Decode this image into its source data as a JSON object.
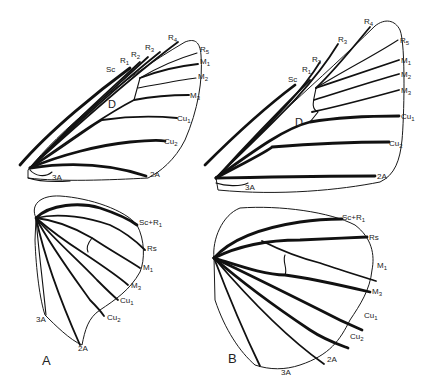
{
  "figure": {
    "panels": [
      {
        "id": "A",
        "label": "A",
        "forewing": {
          "cell_label": "D",
          "vein_labels": [
            "Sc",
            "R1",
            "R2",
            "R3",
            "R4",
            "R5",
            "M1",
            "M2",
            "M3",
            "Cu1",
            "Cu2",
            "2A",
            "3A"
          ]
        },
        "hindwing": {
          "vein_labels": [
            "Sc+R1",
            "Rs",
            "M1",
            "M3",
            "Cu1",
            "Cu2",
            "2A",
            "3A"
          ]
        }
      },
      {
        "id": "B",
        "label": "B",
        "forewing": {
          "cell_label": "D",
          "vein_labels": [
            "Sc",
            "R1",
            "R2",
            "R3",
            "R4",
            "R5",
            "M1",
            "M2",
            "M3",
            "Cu1",
            "Cu2",
            "2A",
            "3A"
          ]
        },
        "hindwing": {
          "vein_labels": [
            "Sc+R1",
            "Rs",
            "M1",
            "M3",
            "Cu1",
            "Cu2",
            "2A",
            "3A"
          ]
        }
      }
    ]
  },
  "labels": {
    "A": {
      "fw": {
        "Sc": "Sc",
        "R1": "R1",
        "R2": "R2",
        "R3": "R3",
        "R4": "R4",
        "R5": "R5",
        "M1": "M1",
        "M2": "M2",
        "M3": "M3",
        "Cu1": "Cu1",
        "Cu2": "Cu2",
        "A2": "2A",
        "A3": "3A",
        "D": "D"
      },
      "hw": {
        "ScR1": "Sc+R1",
        "Rs": "Rs",
        "M1": "M1",
        "M3": "M3",
        "Cu1": "Cu1",
        "Cu2": "Cu2",
        "A2": "2A",
        "A3": "3A"
      },
      "panel": "A"
    },
    "B": {
      "fw": {
        "Sc": "Sc",
        "R1": "R1",
        "R2": "R2",
        "R3": "R3",
        "R4": "R4",
        "R5": "R5",
        "M1": "M1",
        "M2": "M2",
        "M3": "M3",
        "Cu1": "Cu1",
        "Cu2": "Cu2",
        "A2": "2A",
        "A3": "3A",
        "D": "D"
      },
      "hw": {
        "ScR1": "Sc+R1",
        "Rs": "Rs",
        "M1": "M1",
        "M3": "M3",
        "Cu1": "Cu1",
        "Cu2": "Cu2",
        "A2": "2A",
        "A3": "3A"
      },
      "panel": "B"
    }
  }
}
